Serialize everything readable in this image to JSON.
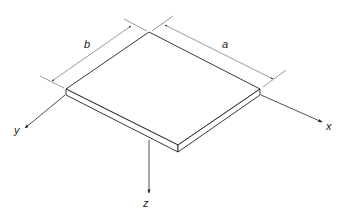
{
  "diagram": {
    "dimensions": {
      "length_label": "a",
      "width_label": "b"
    },
    "axes": {
      "x_label": "x",
      "y_label": "y",
      "z_label": "z"
    },
    "colors": {
      "line": "#222222",
      "dimension_line": "#555555",
      "background": "#ffffff"
    }
  }
}
